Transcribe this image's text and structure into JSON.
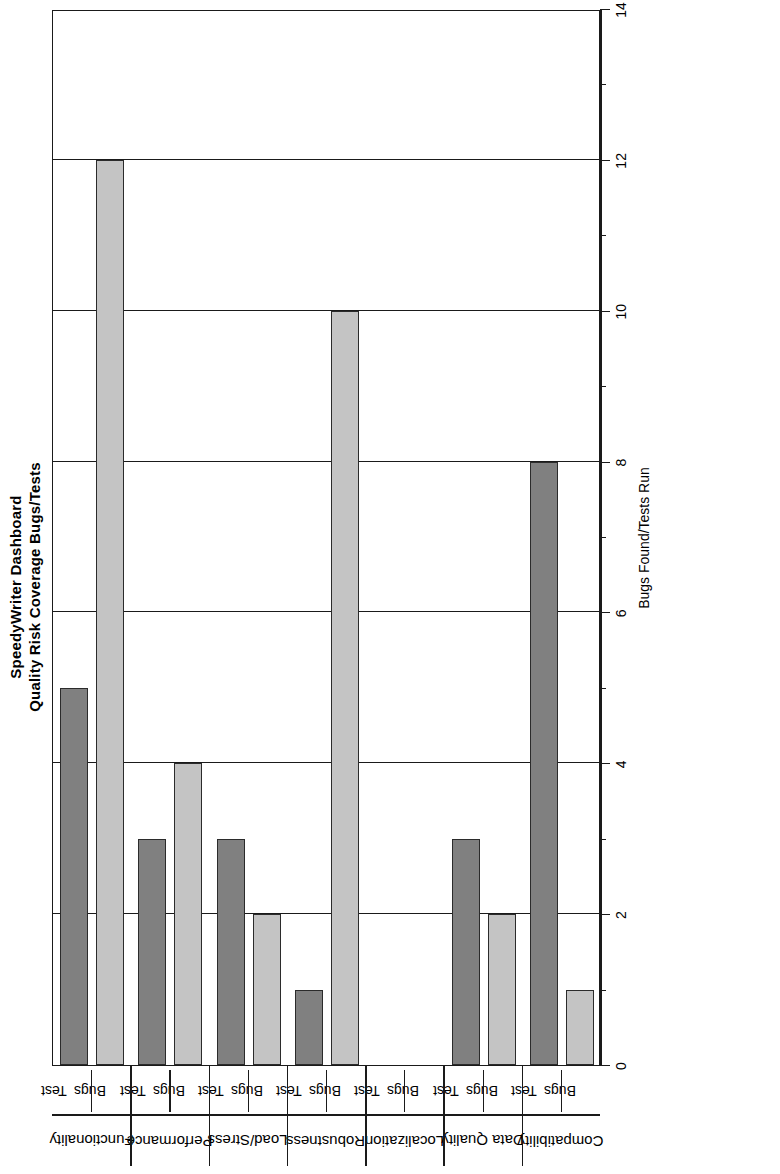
{
  "chart_data": {
    "type": "bar",
    "orientation": "horizontal",
    "title": "SpeedyWriter Dashboard",
    "subtitle": "Quality Risk Coverage Bugs/Tests",
    "xlabel": "Bugs Found/Tests Run",
    "ylabel": "",
    "xlim": [
      0,
      14
    ],
    "grid": true,
    "legend_position": "none",
    "tick_step": 2,
    "minor_tick_step": 1,
    "tick_labels": [
      "0",
      "2",
      "4",
      "6",
      "8",
      "10",
      "12",
      "14"
    ],
    "tick_values": [
      0,
      2,
      4,
      6,
      8,
      10,
      12,
      14
    ],
    "series_names": [
      "Test",
      "Bugs"
    ],
    "categories": [
      "Functionality",
      "Performance",
      "Load/Stress",
      "Robustness",
      "Localization",
      "Data Quality",
      "Compatibility"
    ],
    "series": [
      {
        "name": "Test",
        "color": "#808080",
        "values": [
          5,
          3,
          3,
          1,
          0,
          3,
          8
        ]
      },
      {
        "name": "Bugs",
        "color": "#c4c4c4",
        "values": [
          12,
          4,
          2,
          10,
          0,
          2,
          1
        ]
      }
    ],
    "bars": [
      {
        "category": "Functionality",
        "series": "Test",
        "value": 5
      },
      {
        "category": "Functionality",
        "series": "Bugs",
        "value": 12
      },
      {
        "category": "Performance",
        "series": "Test",
        "value": 3
      },
      {
        "category": "Performance",
        "series": "Bugs",
        "value": 4
      },
      {
        "category": "Load/Stress",
        "series": "Test",
        "value": 3
      },
      {
        "category": "Load/Stress",
        "series": "Bugs",
        "value": 2
      },
      {
        "category": "Robustness",
        "series": "Test",
        "value": 1
      },
      {
        "category": "Robustness",
        "series": "Bugs",
        "value": 10
      },
      {
        "category": "Localization",
        "series": "Test",
        "value": 0
      },
      {
        "category": "Localization",
        "series": "Bugs",
        "value": 0
      },
      {
        "category": "Data Quality",
        "series": "Test",
        "value": 3
      },
      {
        "category": "Data Quality",
        "series": "Bugs",
        "value": 2
      },
      {
        "category": "Compatibility",
        "series": "Test",
        "value": 8
      },
      {
        "category": "Compatibility",
        "series": "Bugs",
        "value": 1
      }
    ]
  },
  "colors": {
    "test_fill": "#808080",
    "bugs_fill": "#c4c4c4",
    "axis": "#1a1a1a",
    "background": "#ffffff"
  }
}
